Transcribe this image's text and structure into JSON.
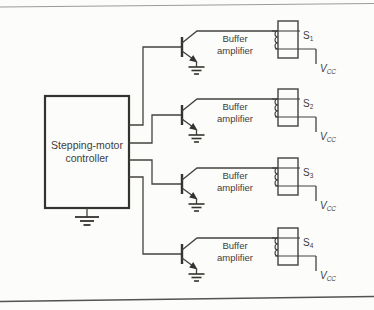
{
  "figure": {
    "controller": {
      "label_line1": "Stepping-motor",
      "label_line2": "controller"
    },
    "channels": [
      {
        "buffer_line1": "Buffer",
        "buffer_line2": "amplifier",
        "switch": "S",
        "switch_sub": "1",
        "supply": "V",
        "supply_sub": "CC"
      },
      {
        "buffer_line1": "Buffer",
        "buffer_line2": "amplifier",
        "switch": "S",
        "switch_sub": "2",
        "supply": "V",
        "supply_sub": "CC"
      },
      {
        "buffer_line1": "Buffer",
        "buffer_line2": "amplifier",
        "switch": "S",
        "switch_sub": "3",
        "supply": "V",
        "supply_sub": "CC"
      },
      {
        "buffer_line1": "Buffer",
        "buffer_line2": "amplifier",
        "switch": "S",
        "switch_sub": "4",
        "supply": "V",
        "supply_sub": "CC"
      }
    ],
    "colors": {
      "line": "#44423f",
      "text": "#3f3d3a",
      "background": "#fcfcfa",
      "rule_top": "#9b9b98",
      "rule_bottom": "#55534f"
    }
  }
}
